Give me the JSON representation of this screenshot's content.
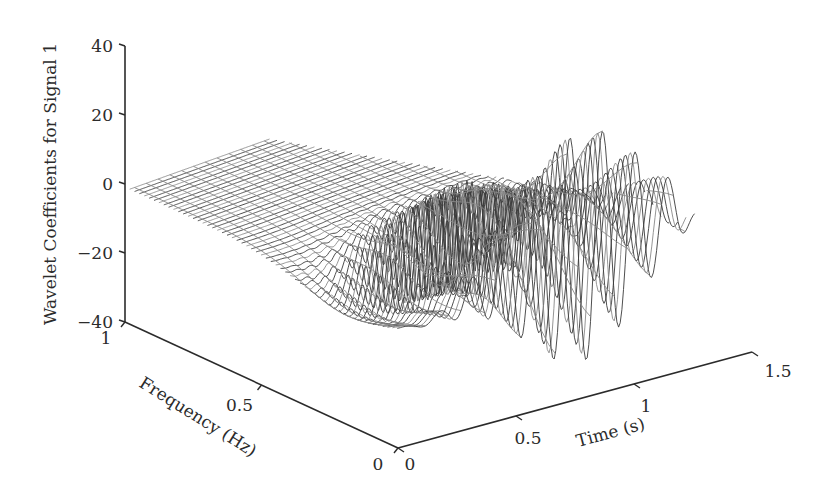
{
  "chart_data": {
    "type": "surface3d",
    "title": "",
    "zlabel": "Wavelet Coefficients for Signal 1",
    "ylabel": "Frequency (Hz)",
    "xlabel": "Time (s)",
    "zlim": [
      -40,
      40
    ],
    "ylim": [
      0,
      1
    ],
    "xlim": [
      0,
      1.5
    ],
    "z_ticks": [
      {
        "value": 40,
        "label": "40"
      },
      {
        "value": 20,
        "label": "20"
      },
      {
        "value": 0,
        "label": "0"
      },
      {
        "value": -20,
        "label": "−20"
      },
      {
        "value": -40,
        "label": "−40"
      }
    ],
    "y_ticks": [
      {
        "value": 1,
        "label": "1"
      },
      {
        "value": 0.5,
        "label": "0.5"
      },
      {
        "value": 0,
        "label": "0"
      }
    ],
    "x_ticks": [
      {
        "value": 0,
        "label": "0"
      },
      {
        "value": 0.5,
        "label": "0.5"
      },
      {
        "value": 1,
        "label": "1"
      },
      {
        "value": 1.5,
        "label": "1.5"
      }
    ],
    "grid": false,
    "legend": null,
    "surface_description": "Wireframe of wavelet coefficients: near-flat sheet around 0 at higher frequencies; strong oscillations at low frequencies between ~0.4 s and ~1.1 s with amplitude up to ~+28 / -38",
    "features": {
      "max_peak_approx": 28,
      "min_trough_approx": -38,
      "oscillation_time_range_s": [
        0.4,
        1.1
      ]
    },
    "colors": {
      "axis": "#2b2b2b",
      "wire_dark": "#3a3a3a",
      "wire_light": "#8a8a8a"
    }
  }
}
